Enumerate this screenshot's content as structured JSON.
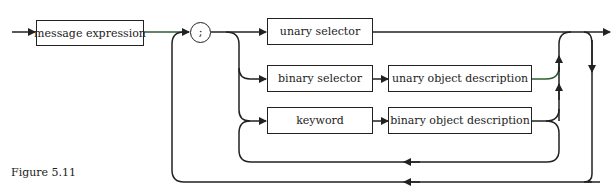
{
  "diagram": {
    "type": "syntax-diagram",
    "nodes": {
      "message_expression": "message expression",
      "semicolon": ";",
      "unary_selector": "unary selector",
      "binary_selector": "binary selector",
      "unary_object_description": "unary object description",
      "keyword": "keyword",
      "binary_object_description": "binary object description"
    },
    "caption": "Figure 5.11",
    "colors": {
      "line": "#222222",
      "accent_line": "#2f5d2f",
      "background": "#ffffff"
    }
  }
}
